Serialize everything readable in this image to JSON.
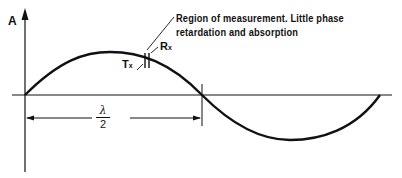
{
  "diagram": {
    "axis_label": "A",
    "annotation": {
      "line1": "Region of measurement. Little phase",
      "line2": "retardation and absorption"
    },
    "receiver_label": "R",
    "receiver_sub": "x",
    "transmitter_label": "T",
    "transmitter_sub": "x",
    "dimension": {
      "numerator": "λ",
      "denominator": "2"
    },
    "colors": {
      "stroke": "#111111",
      "background": "#ffffff"
    }
  }
}
